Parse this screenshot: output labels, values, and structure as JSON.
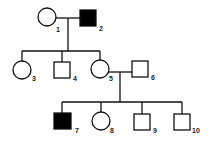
{
  "diagram": {
    "type": "pedigree",
    "colors": {
      "line": "#111111",
      "affected": "#000000",
      "unaffected": "#ffffff"
    },
    "individuals": [
      {
        "id": "1",
        "sex": "female",
        "affected": false,
        "generation": 1
      },
      {
        "id": "2",
        "sex": "male",
        "affected": true,
        "generation": 1
      },
      {
        "id": "3",
        "sex": "female",
        "affected": false,
        "generation": 2
      },
      {
        "id": "4",
        "sex": "male",
        "affected": false,
        "generation": 2
      },
      {
        "id": "5",
        "sex": "female",
        "affected": false,
        "generation": 2
      },
      {
        "id": "6",
        "sex": "male",
        "affected": false,
        "generation": 2
      },
      {
        "id": "7",
        "sex": "male",
        "affected": true,
        "generation": 3
      },
      {
        "id": "8",
        "sex": "female",
        "affected": false,
        "generation": 3
      },
      {
        "id": "9",
        "sex": "male",
        "affected": false,
        "generation": 3
      },
      {
        "id": "10",
        "sex": "male",
        "affected": false,
        "generation": 3
      }
    ],
    "matings": [
      [
        "1",
        "2"
      ],
      [
        "5",
        "6"
      ]
    ],
    "labels": {
      "i1": "1",
      "i2": "2",
      "i3": "3",
      "i4": "4",
      "i5": "5",
      "i6": "6",
      "i7": "7",
      "i8": "8",
      "i9": "9",
      "i10": "10"
    }
  }
}
